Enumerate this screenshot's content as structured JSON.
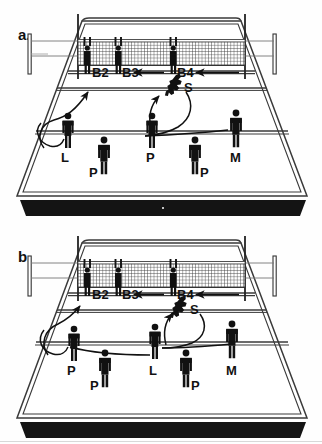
{
  "figure": {
    "panels": [
      {
        "id": "a",
        "label": "a.",
        "blockers": [
          {
            "name": "blocker-b2",
            "label": "B2"
          },
          {
            "name": "blocker-b3",
            "label": "B3"
          },
          {
            "name": "blocker-b4",
            "label": "B4"
          }
        ],
        "attacker": {
          "name": "spiker",
          "label": "S"
        },
        "defenders": [
          {
            "name": "defender-left",
            "label": "L"
          },
          {
            "name": "defender-mid-front-left",
            "label": "P"
          },
          {
            "name": "defender-center",
            "label": "P"
          },
          {
            "name": "defender-mid-front-right",
            "label": "P"
          },
          {
            "name": "defender-right",
            "label": "M"
          }
        ]
      },
      {
        "id": "b",
        "label": "b.",
        "blockers": [
          {
            "name": "blocker-b2",
            "label": "B2"
          },
          {
            "name": "blocker-b3",
            "label": "B3"
          },
          {
            "name": "blocker-b4",
            "label": "B4"
          }
        ],
        "attacker": {
          "name": "spiker",
          "label": "S"
        },
        "defenders": [
          {
            "name": "defender-left",
            "label": "P"
          },
          {
            "name": "defender-mid-front-left",
            "label": "P"
          },
          {
            "name": "defender-center",
            "label": "L"
          },
          {
            "name": "defender-mid-front-right",
            "label": "P"
          },
          {
            "name": "defender-right",
            "label": "M"
          }
        ]
      }
    ],
    "colors": {
      "ink": "#111111",
      "court_line": "#333333",
      "net_mesh": "#555555",
      "shadow_band": "#111111",
      "background": "#fefefe"
    }
  }
}
